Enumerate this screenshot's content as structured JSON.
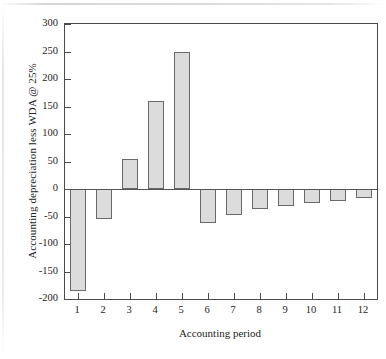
{
  "chart_data": {
    "type": "bar",
    "title": "",
    "xlabel": "Accounting period",
    "ylabel": "Accounting depreciation less WDA @ 25%",
    "categories": [
      "1",
      "2",
      "3",
      "4",
      "5",
      "6",
      "7",
      "8",
      "9",
      "10",
      "11",
      "12"
    ],
    "values": [
      -185,
      -55,
      55,
      160,
      250,
      -62,
      -47,
      -37,
      -31,
      -25,
      -21,
      -16
    ],
    "ylim": [
      -200,
      300
    ],
    "yticks": [
      300,
      250,
      200,
      150,
      100,
      50,
      0,
      -50,
      -100,
      -150,
      -200
    ],
    "ytick_labels": [
      "300",
      "250",
      "200",
      "150",
      "100",
      "50",
      "0",
      "-50",
      "-100",
      "-150",
      "-200"
    ],
    "xlim": [
      0.5,
      12.5
    ],
    "grid": false,
    "legend": null,
    "bar_fill_color": "#dcdcdc",
    "bar_edge_color": "#6a6a6a",
    "axis_color": "#4a4a4a",
    "background_color": "#ffffff"
  }
}
